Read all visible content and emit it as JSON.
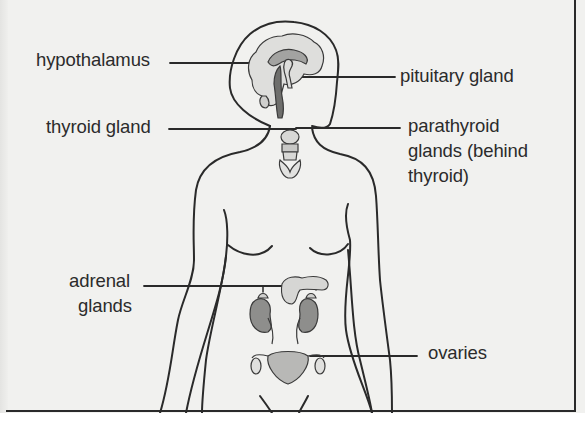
{
  "diagram": {
    "labels": {
      "hypothalamus": "hypothalamus",
      "pituitary": "pituitary gland",
      "thyroid": "thyroid gland",
      "parathyroid_line1": "parathyroid",
      "parathyroid_line2": "glands (behind",
      "parathyroid_line3": "thyroid)",
      "adrenal_line1": "adrenal",
      "adrenal_line2": "glands",
      "ovaries": "ovaries"
    },
    "colors": {
      "line": "#2a2a2a",
      "text": "#2b2b2b",
      "background": "#f1f1ef",
      "organ_fill_light": "#dcdcda",
      "organ_fill_dark": "#8e8e8c"
    }
  }
}
